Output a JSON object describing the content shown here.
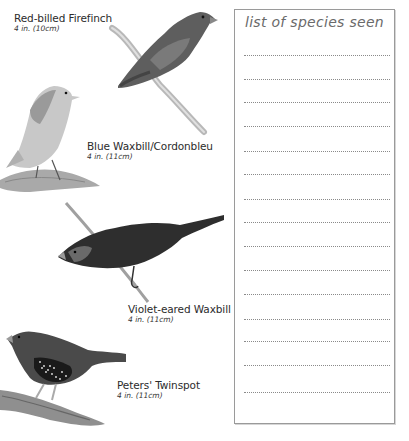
{
  "birds": [
    {
      "name": "Red-billed Firefinch",
      "size": "4 in. (10cm)"
    },
    {
      "name": "Blue Waxbill/Cordonbleu",
      "size": "4 in. (11cm)"
    },
    {
      "name": "Violet-eared Waxbill",
      "size": "4 in. (11cm)"
    },
    {
      "name": "Peters' Twinspot",
      "size": "4 in. (11cm)"
    }
  ],
  "checklist": {
    "title": "list of species seen",
    "line_count": 15,
    "lines": [
      "",
      "",
      "",
      "",
      "",
      "",
      "",
      "",
      "",
      "",
      "",
      "",
      "",
      "",
      ""
    ]
  }
}
